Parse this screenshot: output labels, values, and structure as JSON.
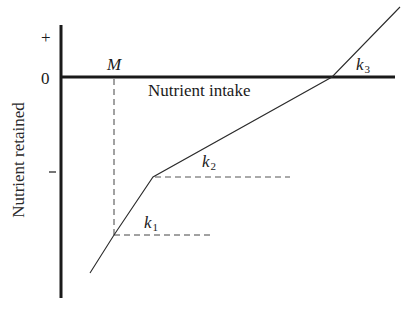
{
  "diagram": {
    "y_axis": {
      "title": "Nutrient retained",
      "tick_plus": "+",
      "tick_zero": "0",
      "tick_minus": "–"
    },
    "x_axis": {
      "title": "Nutrient intake"
    },
    "labels": {
      "M": "M",
      "k1": {
        "base": "k",
        "sub": "1"
      },
      "k2": {
        "base": "k",
        "sub": "2"
      },
      "k3": {
        "base": "k",
        "sub": "3"
      }
    },
    "colors": {
      "axis": "#1a1a1a",
      "line": "#2b2b2b",
      "dashed": "#444444",
      "text": "#1a1a1a"
    },
    "geometry": {
      "y_axis": {
        "x": 61,
        "y1": 25,
        "y2": 298
      },
      "x_axis": {
        "y": 77,
        "x1": 61,
        "x2": 395
      },
      "curve_points": [
        [
          90,
          273
        ],
        [
          114,
          235
        ],
        [
          153,
          177
        ],
        [
          332,
          77
        ],
        [
          400,
          7
        ]
      ],
      "M_dashed_vertical": {
        "x": 114,
        "y1": 78,
        "y2": 235
      },
      "k1_dashed_horizontal": {
        "y": 235,
        "x1": 114,
        "x2": 212
      },
      "k2_dashed_horizontal": {
        "y": 177,
        "x1": 153,
        "x2": 290
      },
      "minus_tick": {
        "y": 172,
        "x1": 49,
        "x2": 57
      }
    }
  }
}
